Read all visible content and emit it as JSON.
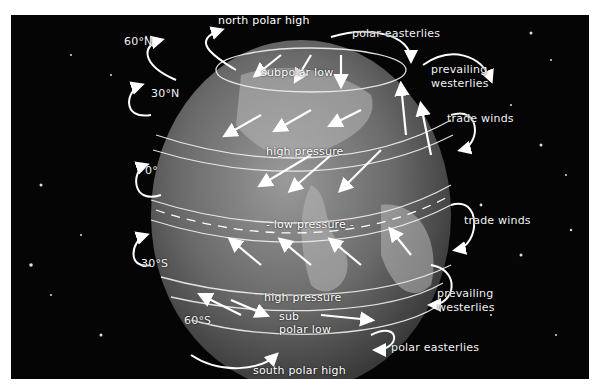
{
  "diagram": {
    "colors": {
      "background": "#050505",
      "globe": "#8a8a8a",
      "arrows": "#ffffff",
      "text": "#f2f2f2",
      "page": "#ffffff"
    },
    "latitudes": [
      {
        "id": "lat-60n",
        "label": "60°N"
      },
      {
        "id": "lat-30n",
        "label": "30°N"
      },
      {
        "id": "lat-0",
        "label": "0°"
      },
      {
        "id": "lat-30s",
        "label": "30°S"
      },
      {
        "id": "lat-60s",
        "label": "60°S"
      }
    ],
    "pressure_zones": [
      {
        "id": "north-polar-high",
        "label": "north polar high"
      },
      {
        "id": "subpolar-low-n",
        "label": "subpolar low"
      },
      {
        "id": "high-pressure-n",
        "label": "high pressure"
      },
      {
        "id": "low-pressure-eq",
        "label": "- low pressure -"
      },
      {
        "id": "high-pressure-s",
        "label": "high pressure"
      },
      {
        "id": "subpolar-low-s-1",
        "label": "sub"
      },
      {
        "id": "subpolar-low-s-2",
        "label": "polar low"
      },
      {
        "id": "south-polar-high",
        "label": "south polar high"
      }
    ],
    "winds": [
      {
        "id": "polar-easterlies-n",
        "label": "polar easterlies"
      },
      {
        "id": "prevailing-westerlies-n-1",
        "label": "prevailing"
      },
      {
        "id": "prevailing-westerlies-n-2",
        "label": "westerlies"
      },
      {
        "id": "trade-winds-n",
        "label": "trade winds"
      },
      {
        "id": "trade-winds-s",
        "label": "trade winds"
      },
      {
        "id": "prevailing-westerlies-s-1",
        "label": "prevailing"
      },
      {
        "id": "prevailing-westerlies-s-2",
        "label": "westerlies"
      },
      {
        "id": "polar-easterlies-s",
        "label": "polar easterlies"
      }
    ]
  }
}
